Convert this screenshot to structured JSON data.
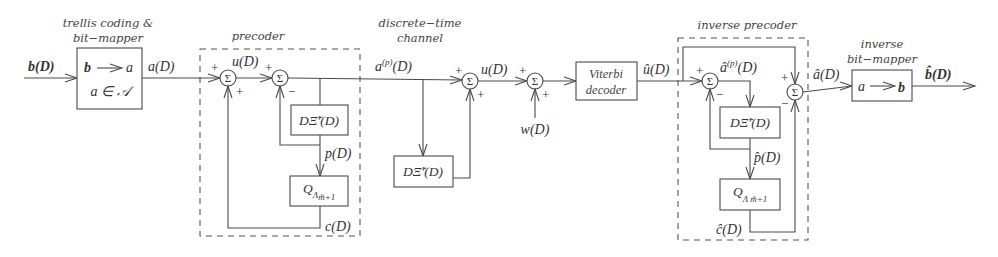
{
  "captions": {
    "mapper_line1": "trellis coding &",
    "mapper_line2": "bit−mapper",
    "precoder": "precoder",
    "channel_line1": "discrete−time",
    "channel_line2": "channel",
    "inverse_precoder": "inverse precoder",
    "inv_mapper_line1": "inverse",
    "inv_mapper_line2": "bit−mapper"
  },
  "signals": {
    "input": "b(D)",
    "mapper_out": "a(D)",
    "precoder_u": "u(D)",
    "precoder_p": "p(D)",
    "precoder_c": "c(D)",
    "precoded": "a",
    "precoded_sup": "(p)",
    "precoded_tail": "(D)",
    "channel_u": "u(D)",
    "noise": "w(D)",
    "decoded_u": "û(D)",
    "inv_a_hat": "â",
    "inv_a_sup": "(p)",
    "inv_a_tail": "(D)",
    "inv_p": "p̂(D)",
    "inv_c": "ĉ(D)",
    "recovered_a": "â(D)",
    "output": "b̂(D)"
  },
  "blocks": {
    "mapper_line1_left": "b",
    "mapper_line1_right": "a",
    "mapper_line2": "a ∈ 𝒜",
    "filter": "DΞ̃′(D)",
    "quantizer": "Q",
    "quantizer_sub": "Λ",
    "quantizer_subsub": "m̃+1",
    "viterbi_line1": "Viterbi",
    "viterbi_line2": "decoder",
    "inv_mapper_left": "a",
    "inv_mapper_right": "b"
  },
  "sum_symbol": "Σ",
  "plus": "+",
  "minus": "−"
}
